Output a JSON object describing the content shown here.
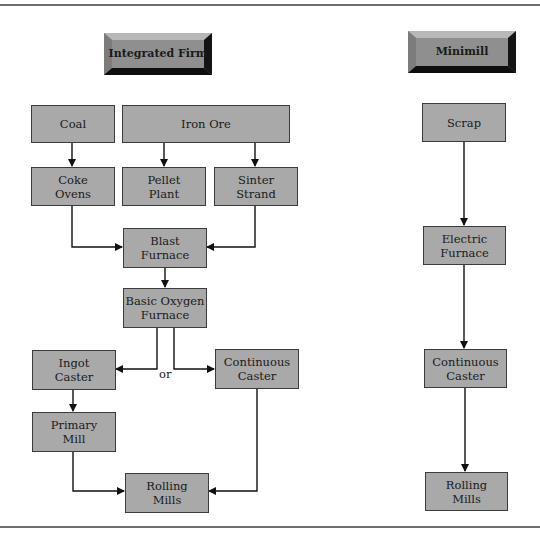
{
  "diagram": {
    "type": "flowchart",
    "colors": {
      "box_fill": "#a9a9a9",
      "box_border": "#3c3c3c",
      "header_fill": "#8f8f8f",
      "arrow": "#111111",
      "rule": "#6e6e6e"
    },
    "integrated": {
      "title": "Integrated Firm",
      "nodes": {
        "coal": "Coal",
        "iron_ore": "Iron Ore",
        "coke_ovens": "Coke\nOvens",
        "pellet_plant": "Pellet\nPlant",
        "sinter_strand": "Sinter\nStrand",
        "blast_furnace": "Blast\nFurnace",
        "bof": "Basic Oxygen\nFurnace",
        "ingot_caster": "Ingot\nCaster",
        "continuous_caster": "Continuous\nCaster",
        "primary_mill": "Primary\nMill",
        "rolling_mills": "Rolling\nMills"
      },
      "or_label": "or",
      "edges": [
        [
          "Coal",
          "Coke Ovens"
        ],
        [
          "Iron Ore",
          "Pellet Plant"
        ],
        [
          "Iron Ore",
          "Sinter Strand"
        ],
        [
          "Coke Ovens",
          "Blast Furnace"
        ],
        [
          "Sinter Strand",
          "Blast Furnace"
        ],
        [
          "Blast Furnace",
          "Basic Oxygen Furnace"
        ],
        [
          "Basic Oxygen Furnace",
          "Ingot Caster"
        ],
        [
          "Basic Oxygen Furnace",
          "Continuous Caster"
        ],
        [
          "Ingot Caster",
          "Primary Mill"
        ],
        [
          "Primary Mill",
          "Rolling Mills"
        ],
        [
          "Continuous Caster",
          "Rolling Mills"
        ]
      ]
    },
    "minimill": {
      "title": "Minimill",
      "nodes": {
        "scrap": "Scrap",
        "electric_furnace": "Electric\nFurnace",
        "continuous_caster": "Continuous\nCaster",
        "rolling_mills": "Rolling\nMills"
      },
      "edges": [
        [
          "Scrap",
          "Electric Furnace"
        ],
        [
          "Electric Furnace",
          "Continuous Caster"
        ],
        [
          "Continuous Caster",
          "Rolling Mills"
        ]
      ]
    }
  }
}
